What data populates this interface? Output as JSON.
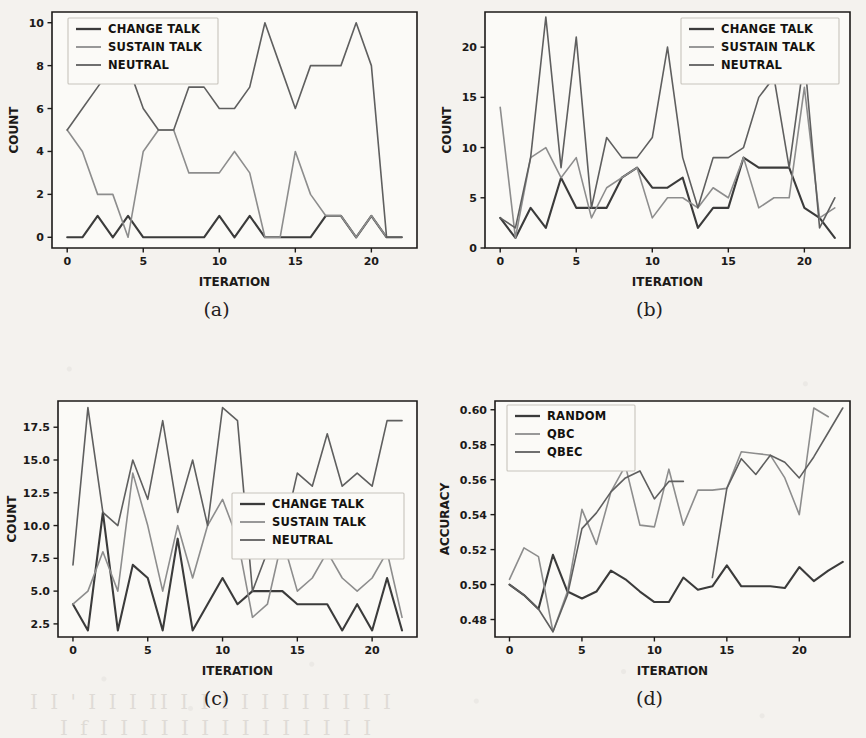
{
  "figure": {
    "panels": [
      {
        "caption": "(a)",
        "xlabel": "ITERATION",
        "ylabel": "COUNT",
        "legend_position": "upper-left",
        "xticks": [
          0,
          5,
          10,
          15,
          20
        ],
        "yticks": [
          0,
          2,
          4,
          6,
          8,
          10
        ]
      },
      {
        "caption": "(b)",
        "xlabel": "ITERATION",
        "ylabel": "COUNT",
        "legend_position": "upper-right",
        "xticks": [
          0,
          5,
          10,
          15,
          20
        ],
        "yticks": [
          0,
          5,
          10,
          15,
          20
        ]
      },
      {
        "caption": "(c)",
        "xlabel": "ITERATION",
        "ylabel": "COUNT",
        "legend_position": "center-right",
        "xticks": [
          0,
          5,
          10,
          15,
          20
        ],
        "yticks": [
          "2.5",
          "5.0",
          "7.5",
          "10.0",
          "12.5",
          "15.0",
          "17.5"
        ]
      },
      {
        "caption": "(d)",
        "xlabel": "ITERATION",
        "ylabel": "ACCURACY",
        "legend_position": "upper-left",
        "xticks": [
          0,
          5,
          10,
          15,
          20
        ],
        "yticks": [
          "0.48",
          "0.50",
          "0.52",
          "0.54",
          "0.56",
          "0.58",
          "0.60"
        ]
      }
    ],
    "colors": {
      "change_talk": "#3b3b3b",
      "sustain_talk": "#8d8d8d",
      "neutral": "#5f5f5f",
      "random": "#3b3b3b",
      "qbc": "#8d8d8d",
      "qbec": "#5f5f5f",
      "axis": "#1c1a18",
      "background": "#f4f2ee",
      "plot_background": "#fbfaf7"
    },
    "bleed_through_text": [
      "(",
      ")",
      "र",
      "े"
    ]
  },
  "chart_data": [
    {
      "type": "line",
      "id": "panel-a",
      "title": "(a)",
      "xlabel": "ITERATION",
      "ylabel": "COUNT",
      "xlim": [
        -1,
        23
      ],
      "ylim": [
        -0.5,
        10.5
      ],
      "grid": false,
      "legend": "upper left",
      "x": [
        0,
        1,
        2,
        3,
        4,
        5,
        6,
        7,
        8,
        9,
        10,
        11,
        12,
        13,
        14,
        15,
        16,
        17,
        18,
        19,
        20,
        21,
        22
      ],
      "series": [
        {
          "name": "CHANGE TALK",
          "color": "#3b3b3b",
          "values": [
            0,
            0,
            1,
            0,
            1,
            0,
            0,
            0,
            0,
            0,
            1,
            0,
            1,
            0,
            0,
            0,
            0,
            1,
            1,
            0,
            1,
            0,
            0
          ]
        },
        {
          "name": "SUSTAIN TALK",
          "color": "#8d8d8d",
          "values": [
            5,
            4,
            2,
            2,
            0,
            4,
            5,
            5,
            3,
            3,
            3,
            4,
            3,
            0,
            0,
            4,
            2,
            1,
            1,
            0,
            1,
            0,
            0
          ]
        },
        {
          "name": "NEUTRAL",
          "color": "#5f5f5f",
          "values": [
            5,
            6,
            7,
            8,
            8,
            6,
            5,
            5,
            7,
            7,
            6,
            6,
            7,
            10,
            8,
            6,
            8,
            8,
            8,
            10,
            8,
            0,
            0
          ]
        }
      ]
    },
    {
      "type": "line",
      "id": "panel-b",
      "title": "(b)",
      "xlabel": "ITERATION",
      "ylabel": "COUNT",
      "xlim": [
        -1,
        23
      ],
      "ylim": [
        0,
        23.5
      ],
      "grid": false,
      "legend": "upper right",
      "x": [
        0,
        1,
        2,
        3,
        4,
        5,
        6,
        7,
        8,
        9,
        10,
        11,
        12,
        13,
        14,
        15,
        16,
        17,
        18,
        19,
        20,
        21,
        22
      ],
      "series": [
        {
          "name": "CHANGE TALK",
          "color": "#3b3b3b",
          "values": [
            3,
            1,
            4,
            2,
            7,
            4,
            4,
            4,
            7,
            8,
            6,
            6,
            7,
            2,
            4,
            4,
            9,
            8,
            8,
            8,
            4,
            3,
            1
          ]
        },
        {
          "name": "SUSTAIN TALK",
          "color": "#8d8d8d",
          "values": [
            14,
            1,
            9,
            10,
            7,
            9,
            3,
            6,
            7,
            8,
            3,
            5,
            5,
            4,
            6,
            5,
            9,
            4,
            5,
            5,
            16,
            3,
            4
          ]
        },
        {
          "name": "NEUTRAL",
          "color": "#5f5f5f",
          "values": [
            3,
            2,
            9,
            23,
            8,
            21,
            4,
            11,
            9,
            9,
            11,
            20,
            9,
            4,
            9,
            9,
            10,
            15,
            17,
            8,
            19,
            2,
            5
          ]
        }
      ]
    },
    {
      "type": "line",
      "id": "panel-c",
      "title": "(c)",
      "xlabel": "ITERATION",
      "ylabel": "COUNT",
      "xlim": [
        -1,
        23
      ],
      "ylim": [
        1.5,
        19.5
      ],
      "grid": false,
      "legend": "center right",
      "x": [
        0,
        1,
        2,
        3,
        4,
        5,
        6,
        7,
        8,
        9,
        10,
        11,
        12,
        13,
        14,
        15,
        16,
        17,
        18,
        19,
        20,
        21,
        22
      ],
      "series": [
        {
          "name": "CHANGE TALK",
          "color": "#3b3b3b",
          "values": [
            4,
            2,
            11,
            2,
            7,
            6,
            2,
            9,
            2,
            4,
            6,
            4,
            5,
            5,
            5,
            4,
            4,
            4,
            2,
            4,
            2,
            6,
            2
          ]
        },
        {
          "name": "SUSTAIN TALK",
          "color": "#8d8d8d",
          "values": [
            4,
            5,
            8,
            5,
            14,
            10,
            5,
            10,
            6,
            10,
            12,
            9,
            3,
            4,
            9,
            5,
            6,
            8,
            6,
            5,
            6,
            8,
            3
          ]
        },
        {
          "name": "NEUTRAL",
          "color": "#5f5f5f",
          "values": [
            7,
            19,
            11,
            10,
            15,
            12,
            18,
            11,
            15,
            10,
            19,
            18,
            5,
            8,
            9,
            14,
            13,
            17,
            13,
            14,
            13,
            18,
            18
          ]
        }
      ]
    },
    {
      "type": "line",
      "id": "panel-d",
      "title": "(d)",
      "xlabel": "ITERATION",
      "ylabel": "ACCURACY",
      "xlim": [
        -1,
        23.5
      ],
      "ylim": [
        0.47,
        0.605
      ],
      "grid": false,
      "legend": "upper left",
      "x": [
        0,
        1,
        2,
        3,
        4,
        5,
        6,
        7,
        8,
        9,
        10,
        11,
        12,
        13,
        14,
        15,
        16,
        17,
        18,
        19,
        20,
        21,
        22,
        23
      ],
      "series": [
        {
          "name": "RANDOM",
          "color": "#3b3b3b",
          "values": [
            0.5,
            0.494,
            0.486,
            0.517,
            0.496,
            0.492,
            0.496,
            0.508,
            0.503,
            0.496,
            0.49,
            0.49,
            0.504,
            0.497,
            0.499,
            0.511,
            0.499,
            0.499,
            0.499,
            0.498,
            0.51,
            0.502,
            0.508,
            0.513
          ]
        },
        {
          "name": "QBC",
          "color": "#8d8d8d",
          "values": [
            0.503,
            0.521,
            0.516,
            0.473,
            0.496,
            0.543,
            0.523,
            0.553,
            0.568,
            0.534,
            0.533,
            0.566,
            0.534,
            0.554,
            0.554,
            0.555,
            0.576,
            0.575,
            0.574,
            0.561,
            0.54,
            0.601,
            0.596,
            null
          ]
        },
        {
          "name": "QBEC",
          "color": "#5f5f5f",
          "values": [
            0.5,
            0.494,
            0.486,
            0.473,
            0.494,
            0.532,
            0.541,
            0.553,
            0.561,
            0.565,
            0.549,
            0.559,
            0.559,
            null,
            0.504,
            0.555,
            0.572,
            0.563,
            0.574,
            0.57,
            0.561,
            0.573,
            0.587,
            0.601
          ]
        }
      ]
    }
  ]
}
